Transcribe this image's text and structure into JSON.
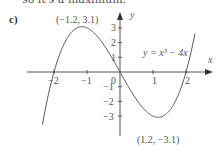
{
  "context_text": "so it's a maximum.",
  "part_label": "c)",
  "chart_data": {
    "type": "line",
    "title": "",
    "equation_label": "y = x³ − 4x",
    "xlabel": "x",
    "ylabel": "y",
    "x_ticks": [
      -2,
      -1,
      0,
      1,
      2
    ],
    "y_ticks": [
      -3,
      -2,
      -1,
      1,
      2,
      3
    ],
    "x_tick_labels": [
      "−2",
      "−1",
      "0",
      "1",
      "2"
    ],
    "y_tick_labels": [
      "−3",
      "−2",
      "−1",
      "1",
      "2",
      "3"
    ],
    "xlim": [
      -2.8,
      2.8
    ],
    "ylim": [
      -4.3,
      4.1
    ],
    "grid": false,
    "legend": "none",
    "function": "x^3 - 4x",
    "annotations": [
      {
        "text": "(−1.2, 3.1)",
        "x": -1.2,
        "y": 3.1,
        "kind": "local maximum"
      },
      {
        "text": "(1.2, −3.1)",
        "x": 1.2,
        "y": -3.1,
        "kind": "local minimum"
      }
    ],
    "roots": [
      -2,
      0,
      2
    ],
    "series": [
      {
        "name": "y = x³ − 4x",
        "x": [
          -2.4,
          -2.2,
          -2.0,
          -1.8,
          -1.6,
          -1.4,
          -1.2,
          -1.0,
          -0.8,
          -0.6,
          -0.4,
          -0.2,
          0.0,
          0.2,
          0.4,
          0.6,
          0.8,
          1.0,
          1.2,
          1.4,
          1.6,
          1.8,
          2.0,
          2.2,
          2.4
        ],
        "y": [
          -4.22,
          -1.85,
          0.0,
          1.37,
          2.3,
          2.86,
          3.07,
          3.0,
          2.69,
          2.18,
          1.54,
          0.79,
          0.0,
          -0.79,
          -1.54,
          -2.18,
          -2.69,
          -3.0,
          -3.07,
          -2.86,
          -2.3,
          -1.37,
          0.0,
          1.85,
          4.22
        ]
      }
    ]
  }
}
